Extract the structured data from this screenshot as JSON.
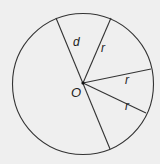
{
  "diagram": {
    "type": "circle-geometry",
    "center": {
      "label": "O",
      "x": 83,
      "y": 83
    },
    "circle": {
      "cx": 83,
      "cy": 84,
      "r": 70.5,
      "stroke": "#333333",
      "stroke_width": 1.1
    },
    "background": "#efefef",
    "segments": [
      {
        "id": "diameter",
        "label": "d",
        "x1": 56,
        "y1": 18,
        "x2": 110,
        "y2": 149,
        "label_x": 73,
        "label_y": 46
      },
      {
        "id": "radius-1",
        "label": "r",
        "x1": 83,
        "y1": 83,
        "x2": 111,
        "y2": 18,
        "label_x": 101,
        "label_y": 52
      },
      {
        "id": "radius-2",
        "label": "r",
        "x1": 83,
        "y1": 83,
        "x2": 151,
        "y2": 69,
        "label_x": 125,
        "label_y": 84
      },
      {
        "id": "radius-3",
        "label": "r",
        "x1": 83,
        "y1": 83,
        "x2": 146,
        "y2": 113,
        "label_x": 125,
        "label_y": 110
      }
    ],
    "labels": {
      "center": "O",
      "diameter": "d",
      "radius": "r"
    }
  }
}
